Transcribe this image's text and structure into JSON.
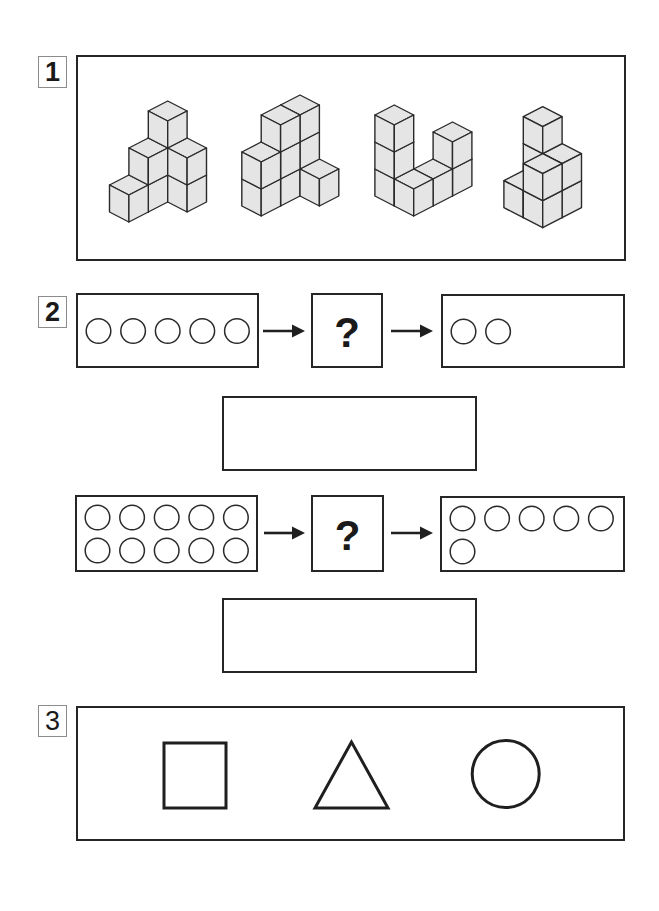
{
  "worksheet": {
    "section1": {
      "label": "1",
      "description": "Four stacks of unit cubes",
      "figures": [
        {
          "name": "cube-figure-1",
          "cube_count": 8,
          "origin": [
            167.7,
            182
          ],
          "columns": [
            [
              0,
              0,
              3
            ],
            [
              0,
              1,
              2
            ],
            [
              1,
              0,
              2
            ],
            [
              0,
              2,
              1
            ]
          ]
        },
        {
          "name": "cube-figure-2",
          "cube_count": 9,
          "origin": [
            300,
            176
          ],
          "columns": [
            [
              0,
              0,
              3
            ],
            [
              0,
              1,
              3
            ],
            [
              0,
              2,
              2
            ],
            [
              1,
              0,
              1
            ]
          ]
        },
        {
          "name": "cube-figure-3",
          "cube_count": 7,
          "origin": [
            394.3,
            186
          ],
          "columns": [
            [
              0,
              0,
              3
            ],
            [
              1,
              0,
              1
            ],
            [
              1,
              -1,
              1
            ],
            [
              1,
              -2,
              2
            ]
          ]
        },
        {
          "name": "cube-figure-4",
          "cube_count": 8,
          "origin": [
            542.7,
            187.7
          ],
          "columns": [
            [
              0,
              0,
              3
            ],
            [
              1,
              0,
              2
            ],
            [
              1,
              1,
              2
            ],
            [
              0,
              1,
              1
            ]
          ]
        }
      ]
    },
    "section2": {
      "label": "2",
      "rows": [
        {
          "input": {
            "circles": 5
          },
          "operator": "?",
          "output": {
            "circles": 2
          }
        },
        {
          "input": {
            "circles": 10
          },
          "operator": "?",
          "output": {
            "circles": 6
          }
        }
      ],
      "answers": [
        "",
        ""
      ]
    },
    "section3": {
      "label": "3",
      "shapes": [
        "square",
        "triangle",
        "circle"
      ]
    }
  },
  "style": {
    "ink": "#222222",
    "cube_fill": "#e5e5e5",
    "cube_stroke": "#2a2a2a",
    "label_border": "#8c8c8c",
    "background": "#ffffff"
  }
}
